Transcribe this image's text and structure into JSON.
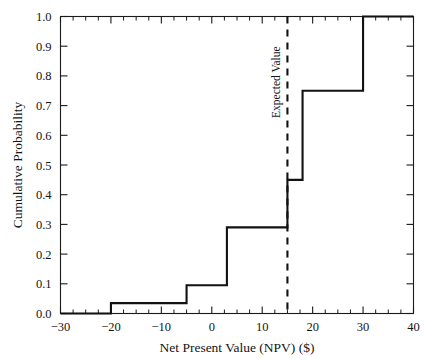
{
  "chart_data": {
    "type": "line",
    "subtype": "step-cdf",
    "title": "",
    "xlabel": "Net Present Value (NPV) ($)",
    "ylabel": "Cumulative Probability",
    "xlim": [
      -30,
      40
    ],
    "ylim": [
      0.0,
      1.0
    ],
    "grid": false,
    "legend": false,
    "x_ticks": [
      -30,
      -20,
      -10,
      0,
      10,
      20,
      30,
      40
    ],
    "x_tick_labels": [
      "−30",
      "−20",
      "−10",
      "0",
      "10",
      "20",
      "30",
      "40"
    ],
    "x_minor_tick_step": 2.5,
    "y_ticks": [
      0.0,
      0.1,
      0.2,
      0.3,
      0.4,
      0.5,
      0.6,
      0.7,
      0.8,
      0.9,
      1.0
    ],
    "y_tick_labels": [
      "0.0",
      "0.1",
      "0.2",
      "0.3",
      "0.4",
      "0.5",
      "0.6",
      "0.7",
      "0.8",
      "0.9",
      "1.0"
    ],
    "steps": [
      {
        "x": -20,
        "y": 0.035
      },
      {
        "x": -5,
        "y": 0.095
      },
      {
        "x": 3,
        "y": 0.29
      },
      {
        "x": 15,
        "y": 0.45
      },
      {
        "x": 18,
        "y": 0.75
      },
      {
        "x": 30,
        "y": 1.0
      }
    ],
    "x": [
      -30,
      -20,
      -20,
      -5,
      -5,
      3,
      3,
      15,
      15,
      18,
      18,
      30,
      30,
      40
    ],
    "y": [
      0.0,
      0.0,
      0.035,
      0.035,
      0.095,
      0.095,
      0.29,
      0.29,
      0.45,
      0.45,
      0.75,
      0.75,
      1.0,
      1.0
    ],
    "annotations": [
      {
        "name": "expected-value",
        "label": "Expected Value",
        "x": 15,
        "style": "dashed-vertical",
        "orientation": "vertical"
      }
    ]
  },
  "axes": {
    "x_title": "Net Present Value (NPV) ($)",
    "y_title": "Cumulative Probability"
  },
  "annotation": {
    "expected_value_label": "Expected Value"
  },
  "colors": {
    "line": "#111111",
    "frame": "#1a1a1a",
    "background": "#ffffff",
    "text": "#141414"
  }
}
